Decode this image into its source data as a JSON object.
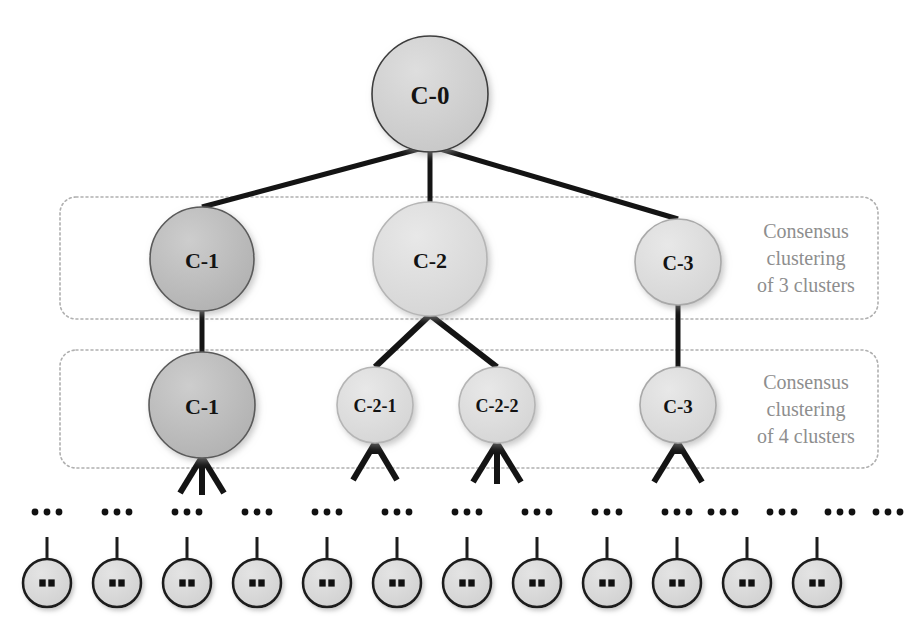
{
  "figure": {
    "name": "hierarchical-consensus-clustering-tree",
    "background": "#ffffff",
    "width": 912,
    "height": 638
  },
  "colors": {
    "edge": "#141414",
    "dotted_border": "#b0b0b0",
    "caption_text": "#8e8e8e",
    "node_label": "#131313",
    "node_fill_dark": "#b9b9b9",
    "node_fill_mid": "#cfcfcf",
    "node_fill_light": "#dcdcdc",
    "node_stroke_dark": "#5a5a5a",
    "node_stroke_light": "#9a9a9a",
    "leaf_fill": "#d9d9d9",
    "leaf_stroke": "#1c1c1c",
    "leaf_dot": "#111111"
  },
  "root": {
    "id": "c0",
    "label": "C-0",
    "cx": 430,
    "cy": 94,
    "r": 58,
    "fill": "#cfcfcf",
    "stroke": "#3c3c3c",
    "font_size": 25
  },
  "levels": [
    {
      "id": "level-3-clusters",
      "caption": "Consensus clustering of 3 clusters",
      "caption_lines": [
        "Consensus",
        "clustering",
        "of 3 clusters"
      ],
      "box": {
        "x": 60,
        "y": 197,
        "w": 818,
        "h": 122,
        "rx": 16
      },
      "caption_x": 806,
      "caption_y": 258,
      "nodes": [
        {
          "id": "c1-a",
          "label": "C-1",
          "cx": 202,
          "cy": 259,
          "r": 52,
          "fill": "#b9b9b9",
          "stroke": "#5a5a5a",
          "font_size": 22
        },
        {
          "id": "c2-a",
          "label": "C-2",
          "cx": 430,
          "cy": 259,
          "r": 57,
          "fill": "#dcdcdc",
          "stroke": "#b5b5b5",
          "font_size": 22
        },
        {
          "id": "c3-a",
          "label": "C-3",
          "cx": 678,
          "cy": 262,
          "r": 43,
          "fill": "#dcdcdc",
          "stroke": "#a9a9a9",
          "font_size": 20
        }
      ]
    },
    {
      "id": "level-4-clusters",
      "caption": "Consensus clustering of 4 clusters",
      "caption_lines": [
        "Consensus",
        "clustering",
        "of 4 clusters"
      ],
      "box": {
        "x": 60,
        "y": 350,
        "w": 818,
        "h": 118,
        "rx": 16
      },
      "caption_x": 806,
      "caption_y": 409,
      "nodes": [
        {
          "id": "c1-b",
          "label": "C-1",
          "cx": 202,
          "cy": 405,
          "r": 53,
          "fill": "#b9b9b9",
          "stroke": "#5a5a5a",
          "font_size": 22
        },
        {
          "id": "c21",
          "label": "C-2-1",
          "cx": 375,
          "cy": 405,
          "r": 38,
          "fill": "#dddddd",
          "stroke": "#b5b5b5",
          "font_size": 18
        },
        {
          "id": "c22",
          "label": "C-2-2",
          "cx": 497,
          "cy": 405,
          "r": 38,
          "fill": "#dddddd",
          "stroke": "#b5b5b5",
          "font_size": 18
        },
        {
          "id": "c3-b",
          "label": "C-3",
          "cx": 678,
          "cy": 405,
          "r": 38,
          "fill": "#dddddd",
          "stroke": "#a9a9a9",
          "font_size": 19
        }
      ]
    }
  ],
  "edges": [
    {
      "from": "c0",
      "to": "c1-a",
      "x1": 430,
      "y1": 146,
      "x2": 202,
      "y2": 207,
      "width": 5
    },
    {
      "from": "c0",
      "to": "c2-a",
      "x1": 430,
      "y1": 146,
      "x2": 430,
      "y2": 202,
      "width": 5
    },
    {
      "from": "c0",
      "to": "c3-a",
      "x1": 430,
      "y1": 146,
      "x2": 678,
      "y2": 219,
      "width": 5
    },
    {
      "from": "c1-a",
      "to": "c1-b",
      "x1": 202,
      "y1": 311,
      "x2": 202,
      "y2": 352,
      "width": 5
    },
    {
      "from": "c2-a",
      "to": "c21",
      "x1": 430,
      "y1": 315,
      "x2": 375,
      "y2": 367,
      "width": 6
    },
    {
      "from": "c2-a",
      "to": "c22",
      "x1": 430,
      "y1": 315,
      "x2": 497,
      "y2": 367,
      "width": 6
    },
    {
      "from": "c3-a",
      "to": "c3-b",
      "x1": 678,
      "y1": 305,
      "x2": 678,
      "y2": 367,
      "width": 5
    }
  ],
  "arrows": [
    {
      "id": "arrow-to-c1",
      "target": "c1-b",
      "tip_x": 202,
      "tip_y": 457,
      "prongs": [
        {
          "x": 180,
          "y": 493
        },
        {
          "x": 202,
          "y": 495
        },
        {
          "x": 224,
          "y": 493
        }
      ],
      "width": 6
    },
    {
      "id": "arrow-to-c21",
      "target": "c21",
      "tip_x": 375,
      "tip_y": 443,
      "prongs": [
        {
          "x": 353,
          "y": 480
        },
        {
          "x": 397,
          "y": 480
        }
      ],
      "width": 6
    },
    {
      "id": "arrow-to-c22",
      "target": "c22",
      "tip_x": 497,
      "tip_y": 443,
      "prongs": [
        {
          "x": 473,
          "y": 482
        },
        {
          "x": 497,
          "y": 484
        },
        {
          "x": 521,
          "y": 482
        }
      ],
      "width": 6
    },
    {
      "id": "arrow-to-c3",
      "target": "c3-b",
      "tip_x": 678,
      "tip_y": 443,
      "prongs": [
        {
          "x": 654,
          "y": 482
        },
        {
          "x": 702,
          "y": 482
        }
      ],
      "width": 6
    }
  ],
  "ellipsis_row": {
    "label": "...",
    "y": 512,
    "dot_r": 3.4,
    "dot_gap": 12,
    "count": 14,
    "x_positions": [
      47,
      117,
      187,
      257,
      327,
      397,
      467,
      537,
      607,
      677,
      723,
      782,
      840,
      888
    ]
  },
  "leaves": {
    "count": 12,
    "inner_label": "::",
    "cy": 583,
    "r": 24,
    "stem_height": 22,
    "fill": "#d9d9d9",
    "x_positions": [
      47,
      117,
      187,
      257,
      327,
      397,
      467,
      537,
      607,
      677,
      747,
      817
    ]
  }
}
